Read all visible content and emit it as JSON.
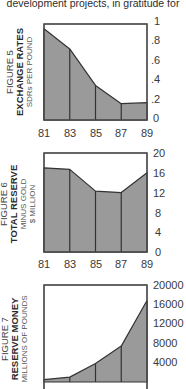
{
  "caption": "development projects, in gratitude for",
  "style": {
    "fill_color": "#9a9a9a",
    "line_color": "#333333",
    "frame_color": "#4a4a4a"
  },
  "figures": [
    {
      "figure_label": "FIGURE 5",
      "title": "EXCHANGE RATES",
      "unit": "SDRs PER POUND",
      "y_ticks": [
        "1",
        ".8",
        ".6",
        ".4",
        ".2",
        "0"
      ],
      "x_ticks": [
        "81",
        "83",
        "85",
        "87",
        "89"
      ]
    },
    {
      "figure_label": "FIGURE 6",
      "title": "TOTAL RESERVE",
      "unit_line1": "MINUS GOLD",
      "unit_line2": "$ MILLION",
      "y_ticks": [
        "20",
        "16",
        "12",
        "8",
        "4",
        "0"
      ],
      "x_ticks": [
        "81",
        "83",
        "85",
        "87",
        "89"
      ]
    },
    {
      "figure_label": "FIGURE 7",
      "title": "RESERVE MONEY",
      "unit": "MILLIONS OF POUNDS",
      "y_ticks": [
        "20000",
        "16000",
        "12000",
        "8000",
        "4000"
      ]
    }
  ],
  "chart_data": [
    {
      "type": "area",
      "title": "FIGURE 5 EXCHANGE RATES",
      "ylabel": "SDRs PER POUND",
      "xlabel": "",
      "categories": [
        "81",
        "83",
        "85",
        "87",
        "89"
      ],
      "values": [
        0.95,
        0.74,
        0.36,
        0.17,
        0.18
      ],
      "ylim": [
        0,
        1
      ],
      "y_ticks": [
        0,
        0.2,
        0.4,
        0.6,
        0.8,
        1
      ],
      "grid": false,
      "legend": "none",
      "y_axis_position": "right"
    },
    {
      "type": "area",
      "title": "FIGURE 6 TOTAL RESERVE MINUS GOLD",
      "ylabel": "$ MILLION",
      "xlabel": "",
      "categories": [
        "81",
        "83",
        "85",
        "87",
        "89"
      ],
      "values": [
        17.0,
        16.7,
        12.3,
        12.0,
        16.0
      ],
      "ylim": [
        0,
        20
      ],
      "y_ticks": [
        0,
        4,
        8,
        12,
        16,
        20
      ],
      "grid": false,
      "legend": "none",
      "y_axis_position": "right"
    },
    {
      "type": "area",
      "title": "FIGURE 7 RESERVE MONEY",
      "ylabel": "MILLIONS OF POUNDS",
      "xlabel": "",
      "categories": [
        "81",
        "83",
        "85",
        "87",
        "89"
      ],
      "values": [
        500,
        1000,
        3800,
        7400,
        16800
      ],
      "ylim": [
        0,
        20000
      ],
      "y_ticks": [
        4000,
        8000,
        12000,
        16000,
        20000
      ],
      "grid": false,
      "legend": "none",
      "y_axis_position": "right",
      "note": "figure cropped at bottom; x-axis labels not visible"
    }
  ]
}
